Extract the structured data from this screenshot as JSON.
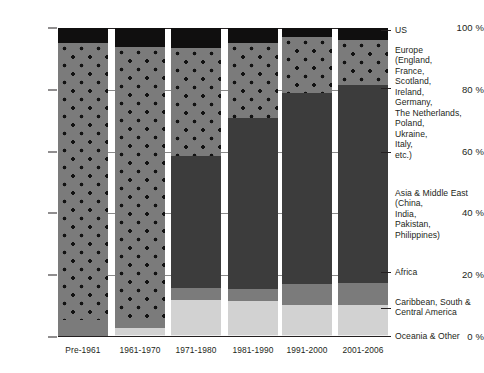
{
  "chart_data": {
    "type": "bar",
    "subtype": "stacked-percentage",
    "title": "",
    "xlabel": "",
    "ylabel": "",
    "ylim": [
      0,
      100
    ],
    "yticks": [
      "0 %",
      "20 %",
      "40 %",
      "60 %",
      "80 %",
      "100 %"
    ],
    "ytick_values": [
      0,
      20,
      40,
      60,
      80,
      100
    ],
    "grid": true,
    "legend_position": "right",
    "categories": [
      "Pre-1961",
      "1961-1970",
      "1971-1980",
      "1981-1990",
      "1991-2000",
      "2001-2006"
    ],
    "series": [
      {
        "name": "US",
        "key": "us",
        "color": "#100f0f",
        "values": [
          5.0,
          6.0,
          6.5,
          5.0,
          3.0,
          4.0
        ]
      },
      {
        "name": "Europe",
        "key": "europe",
        "color": "#7b7b7b",
        "pattern": "dots",
        "values": [
          89.5,
          88.0,
          35.0,
          24.0,
          18.0,
          14.5
        ]
      },
      {
        "name": "Asia & Middle East",
        "key": "asia",
        "color": "#3c3c3c",
        "values": [
          0.0,
          0.0,
          42.5,
          55.5,
          62.0,
          64.0
        ]
      },
      {
        "name": "Africa",
        "key": "africa",
        "color": "#7b7b7b",
        "values": [
          5.5,
          3.0,
          4.0,
          4.0,
          6.5,
          7.0
        ]
      },
      {
        "name": "Caribbean, South & Central America",
        "key": "caribbean",
        "color": "#d2d2d2",
        "values": [
          0.0,
          2.5,
          11.5,
          11.0,
          10.0,
          10.0
        ]
      },
      {
        "name": "Oceania & Other",
        "key": "oceania",
        "color": "#f0f0f0",
        "values": [
          0.0,
          0.5,
          0.5,
          0.5,
          0.5,
          0.5
        ]
      }
    ],
    "legend": [
      {
        "label": "US"
      },
      {
        "label": "Europe\n(England,\nFrance,\nScotland,\nIreland,\nGermany,\nThe Netherlands,\nPoland,\nUkraine,\nItaly,\netc.)"
      },
      {
        "label": "Asia & Middle East\n(China,\nIndia,\nPakistan,\nPhilippines)"
      },
      {
        "label": "Africa"
      },
      {
        "label": "Caribbean, South &\nCentral America"
      },
      {
        "label": "Oceania & Other"
      }
    ]
  }
}
